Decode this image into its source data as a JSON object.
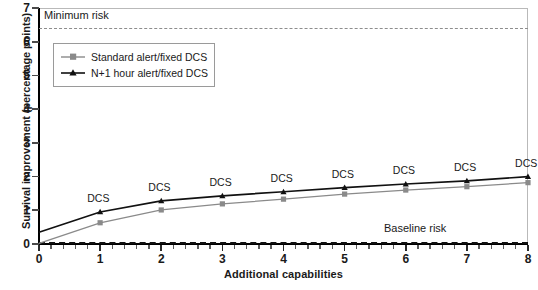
{
  "chart_data": {
    "type": "line",
    "title": "",
    "xlabel": "Additional capabilities",
    "ylabel": "Survival improvement (percentage points)",
    "x": [
      0,
      1,
      2,
      3,
      4,
      5,
      6,
      7,
      8
    ],
    "xlim": [
      0,
      8
    ],
    "ylim": [
      0,
      7
    ],
    "xticks": [
      0,
      1,
      2,
      3,
      4,
      5,
      6,
      7,
      8
    ],
    "yticks": [
      0,
      1,
      2,
      3,
      4,
      5,
      6,
      7
    ],
    "grid": false,
    "legend_position": "upper left",
    "series": [
      {
        "name": "Standard alert/fixed DCS",
        "color": "#8a8a8a",
        "marker": "square",
        "values": [
          0.02,
          0.63,
          1.01,
          1.19,
          1.33,
          1.48,
          1.6,
          1.7,
          1.82
        ]
      },
      {
        "name": "N+1 hour alert/fixed DCS",
        "color": "#111111",
        "marker": "triangle",
        "values": [
          0.35,
          0.95,
          1.28,
          1.43,
          1.55,
          1.67,
          1.78,
          1.87,
          2.0
        ]
      }
    ],
    "reference_lines": [
      {
        "name": "Minimum risk",
        "label": "Minimum risk",
        "value": 6.4,
        "style": "dashed",
        "color": "#8d8d8d"
      },
      {
        "name": "Baseline risk",
        "label": "Baseline risk",
        "value": 0.07,
        "style": "dashed",
        "color": "#111111"
      }
    ],
    "point_annotations": {
      "label": "DCS",
      "at_x": [
        1,
        2,
        3,
        4,
        5,
        6,
        7,
        8
      ]
    }
  },
  "legend": {
    "entries": [
      {
        "label": "Standard alert/fixed DCS"
      },
      {
        "label": "N+1 hour alert/fixed DCS"
      }
    ]
  },
  "axes": {
    "y_tick_labels": [
      "0",
      "1",
      "2",
      "3",
      "4",
      "5",
      "6",
      "7"
    ],
    "x_tick_labels": [
      "0",
      "1",
      "2",
      "3",
      "4",
      "5",
      "6",
      "7",
      "8"
    ]
  }
}
